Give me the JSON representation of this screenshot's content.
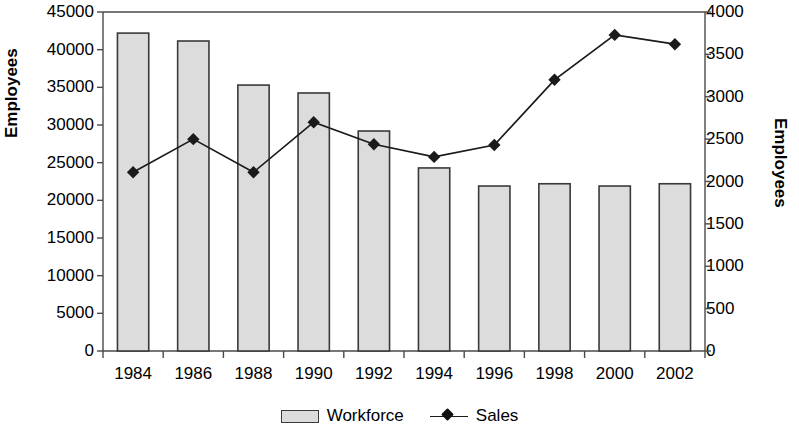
{
  "chart_data": {
    "type": "bar",
    "title": "",
    "subtitle": "",
    "categories": [
      "1984",
      "1986",
      "1988",
      "1990",
      "1992",
      "1994",
      "1996",
      "1998",
      "2000",
      "2002"
    ],
    "xlabel": "",
    "ylabel": "Employees",
    "y2label": "Employees",
    "ylim": [
      0,
      45000
    ],
    "y2lim": [
      0,
      4000
    ],
    "yticks": [
      "0",
      "5000",
      "10000",
      "15000",
      "20000",
      "25000",
      "30000",
      "35000",
      "40000",
      "45000"
    ],
    "y2ticks": [
      "0",
      "500",
      "1000",
      "1500",
      "2000",
      "2500",
      "3000",
      "3500",
      "4000"
    ],
    "grid": false,
    "legend_position": "bottom-center",
    "series": [
      {
        "name": "Workforce",
        "render": "bar",
        "axis": "left",
        "color": "#dcdcdc",
        "edge_color": "#3a3a3a",
        "values": [
          42200,
          41150,
          35300,
          34250,
          29200,
          24300,
          21900,
          22200,
          21900,
          22200
        ]
      },
      {
        "name": "Sales",
        "render": "line",
        "axis": "right",
        "color": "#1a1a1a",
        "marker": "diamond",
        "values": [
          2110,
          2500,
          2110,
          2700,
          2440,
          2290,
          2430,
          3200,
          3730,
          3620
        ]
      }
    ]
  },
  "axes": {
    "left_title": "Employees",
    "right_title": "Employees"
  },
  "legend": {
    "items": [
      {
        "label": "Workforce",
        "marker": "bar-swatch"
      },
      {
        "label": "Sales",
        "marker": "line-diamond"
      }
    ]
  }
}
